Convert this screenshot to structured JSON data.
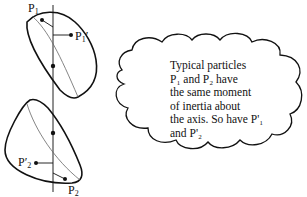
{
  "diagram": {
    "labels": {
      "p1": {
        "main": "P",
        "sub": "1",
        "prime": ""
      },
      "p1_prime": {
        "main": "P",
        "sub": "1",
        "prime": "′"
      },
      "p2": {
        "main": "P",
        "sub": "2",
        "prime": ""
      },
      "p2_prime": {
        "main": "P",
        "sub": "2",
        "prime": "′"
      }
    },
    "cloud": {
      "lines": [
        "Typical particles",
        "P₁ and P₂ have",
        "the same moment",
        "of inertia about",
        "the axis. So have P'₁",
        "and P'₂"
      ]
    },
    "colors": {
      "stroke": "#111111",
      "thin_stroke": "#555555",
      "background": "#ffffff"
    }
  }
}
